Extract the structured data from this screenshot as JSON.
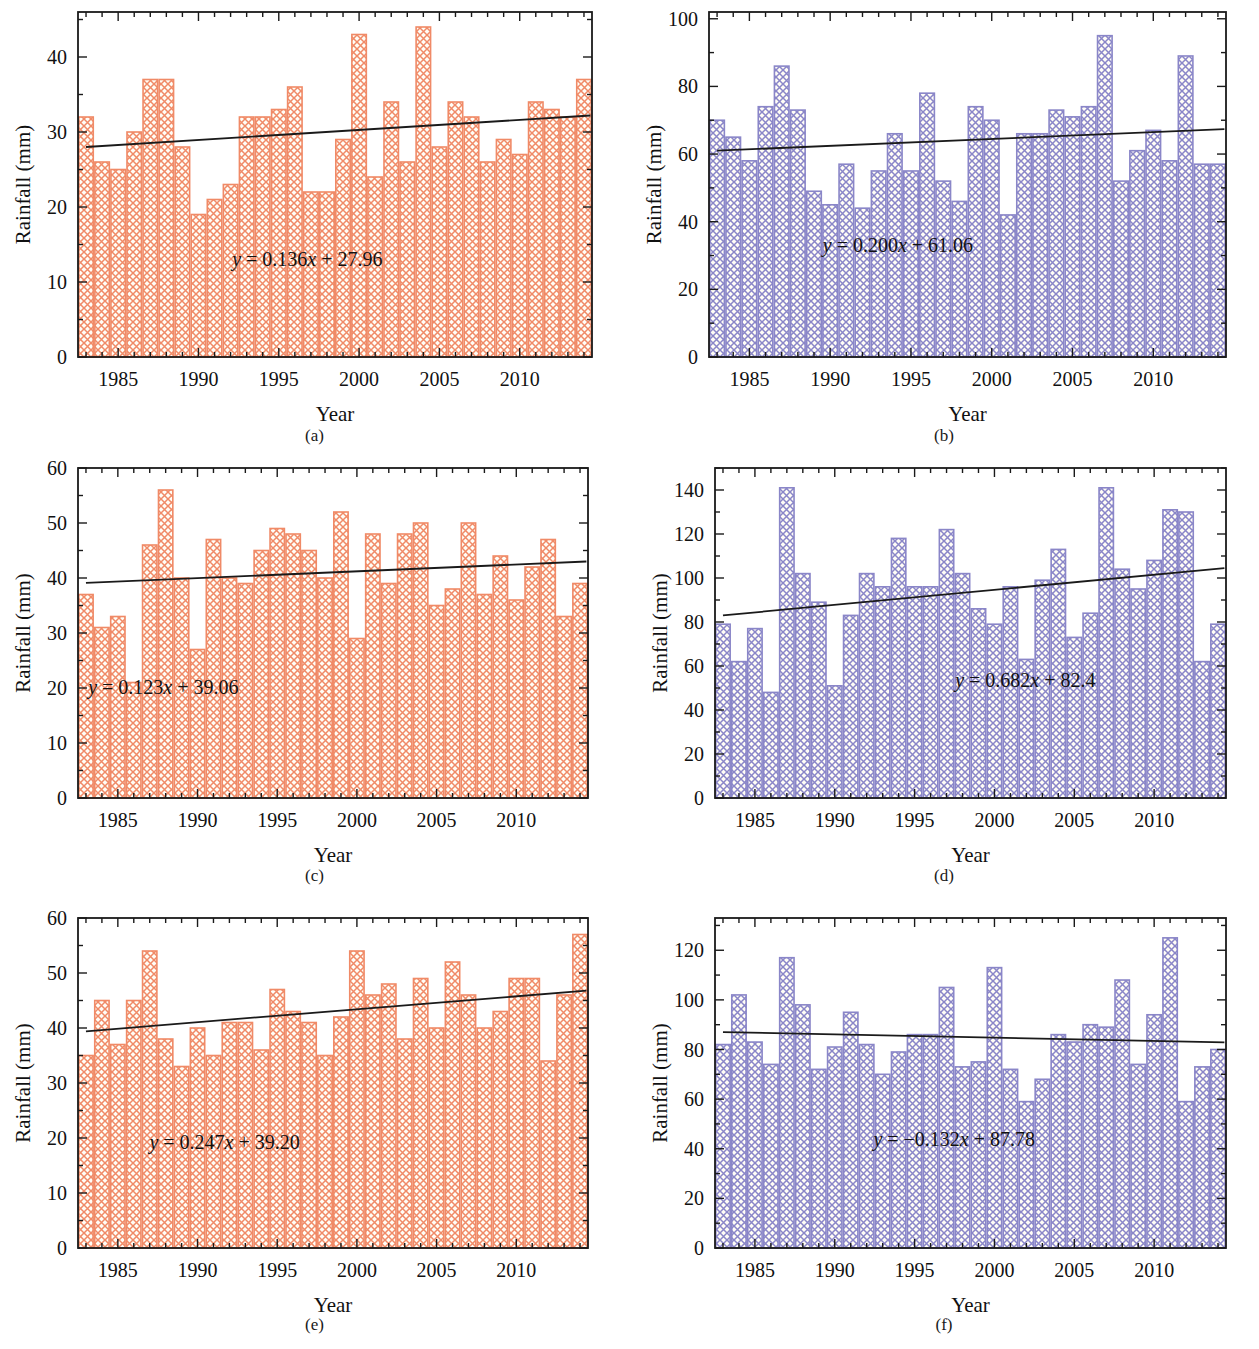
{
  "figure": {
    "panel_count": 6,
    "x_axis_title": "Year",
    "y_axis_title": "Rainfall (mm)",
    "captions": [
      "(a)",
      "(b)",
      "(c)",
      "(d)",
      "(e)",
      "(f)"
    ],
    "colors": {
      "orange_series": "#F08A67",
      "purple_series": "#8A86C8",
      "trendline": "#1a1a1a",
      "axis": "#1a1a1a",
      "background": "#ffffff"
    }
  },
  "chart_data": [
    {
      "panel": "(a)",
      "type": "bar",
      "title": "",
      "xlabel": "Year",
      "ylabel": "Rainfall (mm)",
      "series_color": "#F08A67",
      "xlim": [
        1982.5,
        2014.5
      ],
      "ylim": [
        0,
        46
      ],
      "yticks": [
        0,
        10,
        20,
        30,
        40
      ],
      "xticks": [
        1985,
        1990,
        1995,
        2000,
        2005,
        2010
      ],
      "grid": false,
      "legend": "none",
      "annotation": "y = 0.136x + 27.96",
      "trend": {
        "slope": 0.136,
        "intercept": 27.96,
        "y_start": 28.0,
        "y_end": 32.2
      },
      "categories": [
        1983,
        1984,
        1985,
        1986,
        1987,
        1988,
        1989,
        1990,
        1991,
        1992,
        1993,
        1994,
        1995,
        1996,
        1997,
        1998,
        1999,
        2000,
        2001,
        2002,
        2003,
        2004,
        2005,
        2006,
        2007,
        2008,
        2009,
        2010,
        2011,
        2012,
        2013,
        2014
      ],
      "values": [
        32,
        26,
        25,
        30,
        37,
        37,
        28,
        19,
        21,
        23,
        32,
        32,
        33,
        36,
        22,
        22,
        29,
        43,
        24,
        34,
        26,
        44,
        28,
        34,
        32,
        26,
        29,
        27,
        34,
        33,
        32,
        37
      ]
    },
    {
      "panel": "(b)",
      "type": "bar",
      "title": "",
      "xlabel": "Year",
      "ylabel": "Rainfall (mm)",
      "series_color": "#8A86C8",
      "xlim": [
        1982.5,
        2014.5
      ],
      "ylim": [
        0,
        102
      ],
      "yticks": [
        0,
        20,
        40,
        60,
        80,
        100
      ],
      "xticks": [
        1985,
        1990,
        1995,
        2000,
        2005,
        2010
      ],
      "grid": false,
      "legend": "none",
      "annotation": "y = 0.200x + 61.06",
      "trend": {
        "slope": 0.2,
        "intercept": 61.06,
        "y_start": 61.0,
        "y_end": 67.4
      },
      "categories": [
        1983,
        1984,
        1985,
        1986,
        1987,
        1988,
        1989,
        1990,
        1991,
        1992,
        1993,
        1994,
        1995,
        1996,
        1997,
        1998,
        1999,
        2000,
        2001,
        2002,
        2003,
        2004,
        2005,
        2006,
        2007,
        2008,
        2009,
        2010,
        2011,
        2012,
        2013,
        2014
      ],
      "values": [
        70,
        65,
        58,
        74,
        86,
        73,
        49,
        45,
        57,
        44,
        55,
        66,
        55,
        78,
        52,
        46,
        74,
        70,
        42,
        66,
        66,
        73,
        71,
        74,
        95,
        52,
        61,
        67,
        58,
        89,
        57,
        57
      ]
    },
    {
      "panel": "(c)",
      "type": "bar",
      "title": "",
      "xlabel": "Year",
      "ylabel": "Rainfall (mm)",
      "series_color": "#F08A67",
      "xlim": [
        1982.5,
        2014.5
      ],
      "ylim": [
        0,
        60
      ],
      "yticks": [
        0,
        10,
        20,
        30,
        40,
        50,
        60
      ],
      "xticks": [
        1985,
        1990,
        1995,
        2000,
        2005,
        2010
      ],
      "grid": false,
      "legend": "none",
      "annotation": "y = 0.123x + 39.06",
      "trend": {
        "slope": 0.123,
        "intercept": 39.06,
        "y_start": 39.1,
        "y_end": 43.0
      },
      "categories": [
        1983,
        1984,
        1985,
        1986,
        1987,
        1988,
        1989,
        1990,
        1991,
        1992,
        1993,
        1994,
        1995,
        1996,
        1997,
        1998,
        1999,
        2000,
        2001,
        2002,
        2003,
        2004,
        2005,
        2006,
        2007,
        2008,
        2009,
        2010,
        2011,
        2012,
        2013,
        2014
      ],
      "values": [
        37,
        31,
        33,
        21,
        46,
        56,
        40,
        27,
        47,
        40,
        39,
        45,
        49,
        48,
        45,
        40,
        52,
        29,
        48,
        39,
        48,
        50,
        35,
        38,
        50,
        37,
        44,
        36,
        42,
        47,
        33,
        39
      ]
    },
    {
      "panel": "(d)",
      "type": "bar",
      "title": "",
      "xlabel": "Year",
      "ylabel": "Rainfall (mm)",
      "series_color": "#8A86C8",
      "xlim": [
        1982.5,
        2014.5
      ],
      "ylim": [
        0,
        150
      ],
      "yticks": [
        0,
        20,
        40,
        60,
        80,
        100,
        120,
        140
      ],
      "xticks": [
        1985,
        1990,
        1995,
        2000,
        2005,
        2010
      ],
      "grid": false,
      "legend": "none",
      "annotation": "y = 0.682x + 82.4",
      "trend": {
        "slope": 0.682,
        "intercept": 82.4,
        "y_start": 83.0,
        "y_end": 104.5
      },
      "categories": [
        1983,
        1984,
        1985,
        1986,
        1987,
        1988,
        1989,
        1990,
        1991,
        1992,
        1993,
        1994,
        1995,
        1996,
        1997,
        1998,
        1999,
        2000,
        2001,
        2002,
        2003,
        2004,
        2005,
        2006,
        2007,
        2008,
        2009,
        2010,
        2011,
        2012,
        2013,
        2014
      ],
      "values": [
        79,
        62,
        77,
        48,
        141,
        102,
        89,
        51,
        83,
        102,
        96,
        118,
        96,
        96,
        122,
        102,
        86,
        79,
        96,
        63,
        99,
        113,
        73,
        84,
        141,
        104,
        95,
        108,
        131,
        130,
        62,
        79
      ]
    },
    {
      "panel": "(e)",
      "type": "bar",
      "title": "",
      "xlabel": "Year",
      "ylabel": "Rainfall (mm)",
      "series_color": "#F08A67",
      "xlim": [
        1982.5,
        2014.5
      ],
      "ylim": [
        0,
        60
      ],
      "yticks": [
        0,
        10,
        20,
        30,
        40,
        50,
        60
      ],
      "xticks": [
        1985,
        1990,
        1995,
        2000,
        2005,
        2010
      ],
      "grid": false,
      "legend": "none",
      "annotation": "y = 0.247x + 39.20",
      "trend": {
        "slope": 0.247,
        "intercept": 39.2,
        "y_start": 39.4,
        "y_end": 46.8
      },
      "categories": [
        1983,
        1984,
        1985,
        1986,
        1987,
        1988,
        1989,
        1990,
        1991,
        1992,
        1993,
        1994,
        1995,
        1996,
        1997,
        1998,
        1999,
        2000,
        2001,
        2002,
        2003,
        2004,
        2005,
        2006,
        2007,
        2008,
        2009,
        2010,
        2011,
        2012,
        2013,
        2014
      ],
      "values": [
        35,
        45,
        37,
        45,
        54,
        38,
        33,
        40,
        35,
        41,
        41,
        36,
        47,
        43,
        41,
        35,
        42,
        54,
        46,
        48,
        38,
        49,
        40,
        52,
        46,
        40,
        43,
        49,
        49,
        34,
        46,
        57
      ]
    },
    {
      "panel": "(f)",
      "type": "bar",
      "title": "",
      "xlabel": "Year",
      "ylabel": "Rainfall (mm)",
      "series_color": "#8A86C8",
      "xlim": [
        1982.5,
        2014.5
      ],
      "ylim": [
        0,
        133
      ],
      "yticks": [
        0,
        20,
        40,
        60,
        80,
        100,
        120
      ],
      "xticks": [
        1985,
        1990,
        1995,
        2000,
        2005,
        2010
      ],
      "grid": false,
      "legend": "none",
      "annotation": "y = −0.132x + 87.78",
      "trend": {
        "slope": -0.132,
        "intercept": 87.78,
        "y_start": 87.0,
        "y_end": 82.9
      },
      "categories": [
        1983,
        1984,
        1985,
        1986,
        1987,
        1988,
        1989,
        1990,
        1991,
        1992,
        1993,
        1994,
        1995,
        1996,
        1997,
        1998,
        1999,
        2000,
        2001,
        2002,
        2003,
        2004,
        2005,
        2006,
        2007,
        2008,
        2009,
        2010,
        2011,
        2012,
        2013,
        2014
      ],
      "values": [
        82,
        102,
        83,
        74,
        117,
        98,
        72,
        81,
        95,
        82,
        70,
        79,
        86,
        86,
        105,
        73,
        75,
        113,
        72,
        59,
        68,
        86,
        83,
        90,
        89,
        108,
        74,
        94,
        125,
        59,
        73,
        80
      ]
    }
  ]
}
